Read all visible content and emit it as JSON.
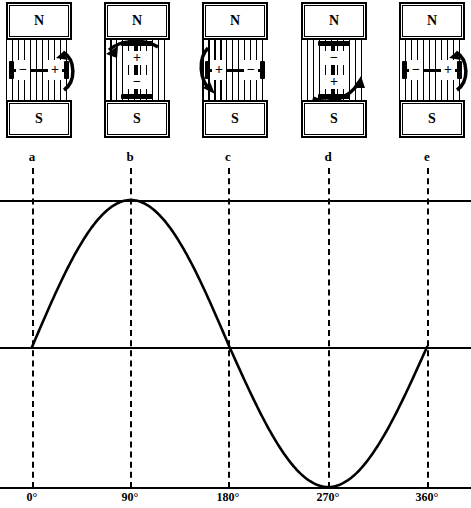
{
  "figure": {
    "stroke_color": "#000000",
    "background_color": "#ffffff"
  },
  "magnet_panels": [
    {
      "id": "panel-a",
      "marker": "a",
      "angle_label": "0°",
      "north_label": "N",
      "south_label": "S",
      "coil_orientation": "horizontal",
      "left_terminal": "−",
      "right_terminal": "+",
      "rotation_arrow": "right-side-upward"
    },
    {
      "id": "panel-b",
      "marker": "b",
      "angle_label": "90°",
      "north_label": "N",
      "south_label": "S",
      "coil_orientation": "vertical",
      "top_terminal": "+",
      "bottom_terminal": "−",
      "rotation_arrow": "top-leftward"
    },
    {
      "id": "panel-c",
      "marker": "c",
      "angle_label": "180°",
      "north_label": "N",
      "south_label": "S",
      "coil_orientation": "horizontal",
      "left_terminal": "+",
      "right_terminal": "−",
      "rotation_arrow": "left-side-downward"
    },
    {
      "id": "panel-d",
      "marker": "d",
      "angle_label": "270°",
      "north_label": "N",
      "south_label": "S",
      "coil_orientation": "vertical",
      "top_terminal": "−",
      "bottom_terminal": "+",
      "rotation_arrow": "bottom-rightward"
    },
    {
      "id": "panel-e",
      "marker": "e",
      "angle_label": "360°",
      "north_label": "N",
      "south_label": "S",
      "coil_orientation": "horizontal",
      "left_terminal": "−",
      "right_terminal": "+",
      "rotation_arrow": "right-side-upward"
    }
  ],
  "markers": [
    "a",
    "b",
    "c",
    "d",
    "e"
  ],
  "chart_data": {
    "type": "line",
    "title": "",
    "xlabel": "",
    "ylabel": "",
    "x_tick_labels": [
      "0°",
      "90°",
      "180°",
      "270°",
      "360°"
    ],
    "x_tick_values": [
      0,
      90,
      180,
      270,
      360
    ],
    "xlim": [
      0,
      360
    ],
    "ylim": [
      -1,
      1
    ],
    "grid": false,
    "legend": null,
    "reference_lines": [
      {
        "name": "positive-peak-line",
        "y": 1
      },
      {
        "name": "zero-line",
        "y": 0
      },
      {
        "name": "negative-peak-line",
        "y": -1
      }
    ],
    "vertical_markers": [
      {
        "label": "a",
        "x": 0
      },
      {
        "label": "b",
        "x": 90
      },
      {
        "label": "c",
        "x": 180
      },
      {
        "label": "d",
        "x": 270
      },
      {
        "label": "e",
        "x": 360
      }
    ],
    "series": [
      {
        "name": "induced EMF",
        "function": "sin",
        "x": [
          0,
          15,
          30,
          45,
          60,
          75,
          90,
          105,
          120,
          135,
          150,
          165,
          180,
          195,
          210,
          225,
          240,
          255,
          270,
          285,
          300,
          315,
          330,
          345,
          360
        ],
        "values": [
          0,
          0.259,
          0.5,
          0.707,
          0.866,
          0.966,
          1,
          0.966,
          0.866,
          0.707,
          0.5,
          0.259,
          0,
          -0.259,
          -0.5,
          -0.707,
          -0.866,
          -0.966,
          -1,
          -0.966,
          -0.866,
          -0.707,
          -0.5,
          -0.259,
          0
        ]
      }
    ]
  }
}
